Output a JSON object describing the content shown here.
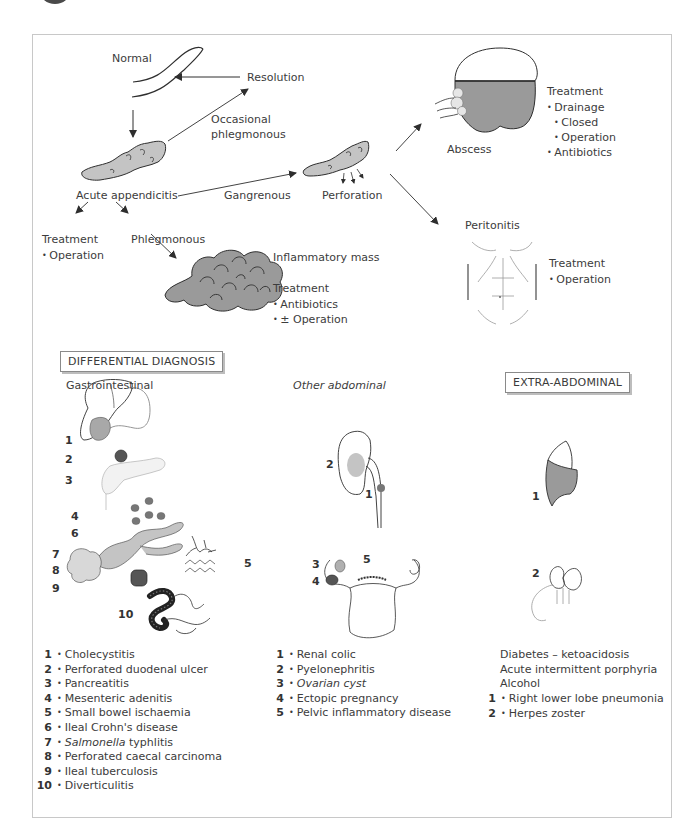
{
  "colors": {
    "tissue_fill": "#c4c4c4",
    "dark_fill": "#6b6b6b",
    "line": "#2e2e2e",
    "frame": "#c8c8c8"
  },
  "pathway": {
    "normal": "Normal",
    "resolution": "Resolution",
    "occasional_phlegmonous_1": "Occasional",
    "occasional_phlegmonous_2": "phlegmonous",
    "acute_appendicitis": "Acute appendicitis",
    "gangrenous": "Gangrenous",
    "perforation": "Perforation",
    "abscess": "Abscess",
    "abscess_treatment": {
      "heading": "Treatment",
      "items": [
        "Drainage",
        "Closed",
        "Operation",
        "Antibiotics"
      ]
    },
    "peritonitis": "Peritonitis",
    "peritonitis_treatment": {
      "heading": "Treatment",
      "items": [
        "Operation"
      ]
    },
    "acute_treatment": {
      "heading": "Treatment",
      "items": [
        "Operation"
      ]
    },
    "phlegmonous": "Phlegmonous",
    "inflammatory_mass": "Inflammatory mass",
    "mass_treatment": {
      "heading": "Treatment",
      "items": [
        "Antibiotics",
        "± Operation"
      ]
    }
  },
  "differential": {
    "title": "DIFFERENTIAL DIAGNOSIS",
    "gastrointestinal": {
      "heading": "Gastrointestinal",
      "figure_numbers": [
        "1",
        "2",
        "3",
        "4",
        "6",
        "7",
        "8",
        "9",
        "5",
        "10"
      ],
      "items": [
        {
          "n": "1",
          "label": "Cholecystitis"
        },
        {
          "n": "2",
          "label": "Perforated duodenal ulcer"
        },
        {
          "n": "3",
          "label": "Pancreatitis"
        },
        {
          "n": "4",
          "label": "Mesenteric adenitis"
        },
        {
          "n": "5",
          "label": "Small bowel ischaemia"
        },
        {
          "n": "6",
          "label": "Ileal Crohn's disease"
        },
        {
          "n": "7",
          "label_italic": "Salmonella",
          "label": " typhlitis"
        },
        {
          "n": "8",
          "label": "Perforated caecal carcinoma"
        },
        {
          "n": "9",
          "label": "Ileal tuberculosis"
        },
        {
          "n": "10",
          "label": "Diverticulitis"
        }
      ]
    },
    "other_abdominal": {
      "heading": "Other abdominal",
      "figure_numbers": [
        "2",
        "1",
        "3",
        "5",
        "4"
      ],
      "items": [
        {
          "n": "1",
          "label": "Renal colic"
        },
        {
          "n": "2",
          "label": "Pyelonephritis"
        },
        {
          "n": "3",
          "label": "Ovarian cyst"
        },
        {
          "n": "4",
          "label": "Ectopic pregnancy"
        },
        {
          "n": "5",
          "label": "Pelvic inflammatory disease"
        }
      ]
    },
    "extra_abdominal": {
      "title": "EXTRA-ABDOMINAL",
      "figure_numbers": [
        "1",
        "2"
      ],
      "plain_items": [
        "Diabetes – ketoacidosis",
        "Acute intermittent porphyria",
        "Alcohol"
      ],
      "items": [
        {
          "n": "1",
          "label": "Right lower lobe pneumonia"
        },
        {
          "n": "2",
          "label": "Herpes zoster"
        }
      ]
    }
  }
}
